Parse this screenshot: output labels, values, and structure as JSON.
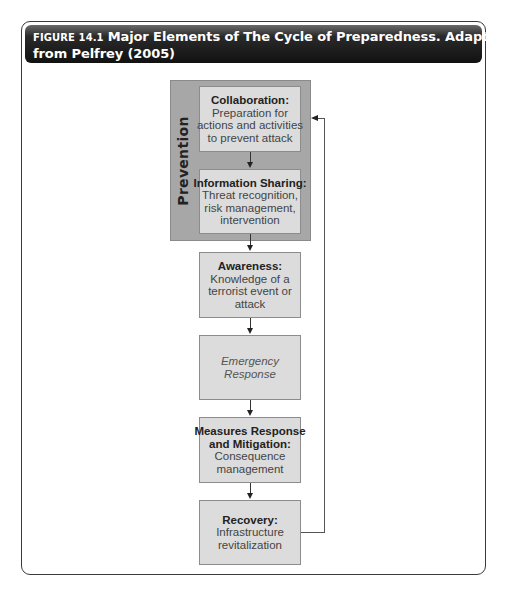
{
  "figure": {
    "label": "FIGURE 14.1",
    "title_line1": "Major Elements of The Cycle of Preparedness. Adapted",
    "title_line2": "from Pelfrey (2005)"
  },
  "diagram": {
    "group": {
      "label": "Prevention",
      "color": "#a7a7a7"
    },
    "nodes": [
      {
        "id": "collaboration",
        "title": "Collaboration:",
        "lines": [
          "Preparation for",
          "actions and activities",
          "to prevent attack"
        ],
        "group": "prevention"
      },
      {
        "id": "information-sharing",
        "title": "Information Sharing:",
        "lines": [
          "Threat recognition,",
          "risk management,",
          "intervention"
        ],
        "group": "prevention"
      },
      {
        "id": "awareness",
        "title": "Awareness:",
        "lines": [
          "Knowledge of a",
          "terrorist event or",
          "attack"
        ]
      },
      {
        "id": "emergency-response",
        "title": "",
        "lines": [
          "Emergency",
          "Response"
        ],
        "italic": true
      },
      {
        "id": "measures",
        "title": "Measures Response and Mitigation:",
        "title_lines": [
          "Measures Response",
          "and Mitigation:"
        ],
        "lines": [
          "Consequence",
          "management"
        ]
      },
      {
        "id": "recovery",
        "title": "Recovery:",
        "lines": [
          "Infrastructure",
          "revitalization"
        ]
      }
    ],
    "edges": [
      {
        "from": "collaboration",
        "to": "information-sharing"
      },
      {
        "from": "information-sharing",
        "to": "awareness"
      },
      {
        "from": "awareness",
        "to": "emergency-response"
      },
      {
        "from": "emergency-response",
        "to": "measures"
      },
      {
        "from": "measures",
        "to": "recovery"
      },
      {
        "from": "recovery",
        "to": "prevention",
        "type": "feedback"
      }
    ],
    "box_fill": "#dcdcdc"
  }
}
